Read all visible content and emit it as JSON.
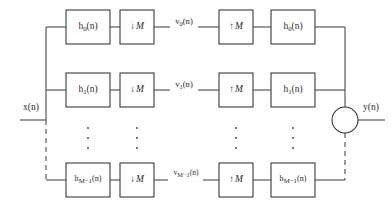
{
  "diagram": {
    "type": "block-diagram",
    "width": 391,
    "height": 212,
    "colors": {
      "background": "#ffffff",
      "line": "#4a4a4a",
      "box_stroke": "#3a3a3a",
      "text": "#2b2b2b"
    },
    "io": {
      "input_label": "x(n)",
      "output_label": "y(n)"
    },
    "summing_junction": {
      "name": "adder",
      "symbol": ""
    },
    "columns": [
      {
        "key": "analysis_filter",
        "name": "analysis-filter"
      },
      {
        "key": "decimator",
        "name": "decimator"
      },
      {
        "key": "subband_signal",
        "name": "subband-signal"
      },
      {
        "key": "interpolator",
        "name": "interpolator"
      },
      {
        "key": "synthesis_filter",
        "name": "synthesis-filter"
      }
    ],
    "rows": [
      {
        "index": 0,
        "analysis_filter": "h0(n)",
        "analysis_filter_base": "h",
        "analysis_filter_sub": "0",
        "analysis_filter_tail": "(n)",
        "decimator": "↓M",
        "decimator_arrow": "↓",
        "decimator_factor": "M",
        "subband_signal": "v0(n)",
        "subband_signal_base": "v",
        "subband_signal_sub": "0",
        "subband_signal_tail": "(n)",
        "interpolator": "↑M",
        "interpolator_arrow": "↑",
        "interpolator_factor": "M",
        "synthesis_filter": "h0(n)",
        "synthesis_filter_base": "h",
        "synthesis_filter_sub": "0",
        "synthesis_filter_tail": "(n)"
      },
      {
        "index": 1,
        "analysis_filter": "h1(n)",
        "analysis_filter_base": "h",
        "analysis_filter_sub": "1",
        "analysis_filter_tail": "(n)",
        "decimator": "↓M",
        "decimator_arrow": "↓",
        "decimator_factor": "M",
        "subband_signal": "v1(n)",
        "subband_signal_base": "v",
        "subband_signal_sub": "1",
        "subband_signal_tail": "(n)",
        "interpolator": "↑M",
        "interpolator_arrow": "↑",
        "interpolator_factor": "M",
        "synthesis_filter": "h1(n)",
        "synthesis_filter_base": "h",
        "synthesis_filter_sub": "1",
        "synthesis_filter_tail": "(n)"
      },
      {
        "index": 2,
        "analysis_filter": "hM-1(n)",
        "analysis_filter_base": "h",
        "analysis_filter_sub": "M−1",
        "analysis_filter_tail": "(n)",
        "decimator": "↓M",
        "decimator_arrow": "↓",
        "decimator_factor": "M",
        "subband_signal": "vM-1(n)",
        "subband_signal_base": "v",
        "subband_signal_sub": "M−1",
        "subband_signal_tail": "(n)",
        "interpolator": "↑M",
        "interpolator_arrow": "↑",
        "interpolator_factor": "M",
        "synthesis_filter": "hM-1(n)",
        "synthesis_filter_base": "h",
        "synthesis_filter_sub": "M−1",
        "synthesis_filter_tail": "(n)"
      }
    ],
    "ellipsis": {
      "glyph": "⋮",
      "dot_count": 3,
      "columns": 4
    }
  }
}
